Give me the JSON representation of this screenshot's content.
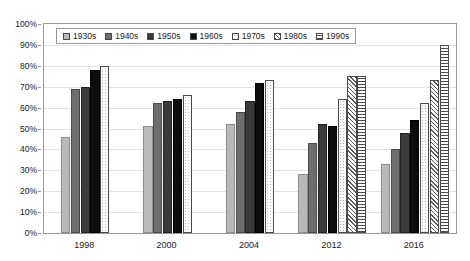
{
  "chart_data": {
    "type": "bar",
    "title": "",
    "xlabel": "",
    "ylabel": "",
    "ylim": [
      0,
      100
    ],
    "ytick_labels": [
      "100%",
      "90%",
      "80%",
      "70%",
      "60%",
      "50%",
      "40%",
      "30%",
      "20%",
      "10%",
      "0%"
    ],
    "ytick_values": [
      100,
      90,
      80,
      70,
      60,
      50,
      40,
      30,
      20,
      10,
      0
    ],
    "grid": true,
    "legend_position": "top-left",
    "categories": [
      "1998",
      "2000",
      "2004",
      "2012",
      "2016"
    ],
    "series": [
      {
        "name": "1930s",
        "values": [
          46,
          51,
          52,
          28,
          33
        ]
      },
      {
        "name": "1940s",
        "values": [
          69,
          62,
          58,
          43,
          40
        ]
      },
      {
        "name": "1950s",
        "values": [
          70,
          63,
          63,
          52,
          48
        ]
      },
      {
        "name": "1960s",
        "values": [
          78,
          64,
          72,
          51,
          54
        ]
      },
      {
        "name": "1970s",
        "values": [
          80,
          66,
          73,
          64,
          62
        ]
      },
      {
        "name": "1980s",
        "values": [
          null,
          null,
          null,
          75,
          73
        ]
      },
      {
        "name": "1990s",
        "values": [
          null,
          null,
          null,
          75,
          90
        ]
      }
    ]
  },
  "legend": {
    "items": [
      {
        "label": "1930s",
        "pattern": "p1930s"
      },
      {
        "label": "1940s",
        "pattern": "p1940s"
      },
      {
        "label": "1950s",
        "pattern": "p1950s"
      },
      {
        "label": "1960s",
        "pattern": "p1960s"
      },
      {
        "label": "1970s",
        "pattern": "p1970s"
      },
      {
        "label": "1980s",
        "pattern": "p1980s"
      },
      {
        "label": "1990s",
        "pattern": "p1990s"
      }
    ]
  },
  "colors": {
    "frame": "#9a9a9a",
    "grid": "#e3e3e3",
    "text": "#1a1a1a",
    "background": "#ffffff"
  }
}
